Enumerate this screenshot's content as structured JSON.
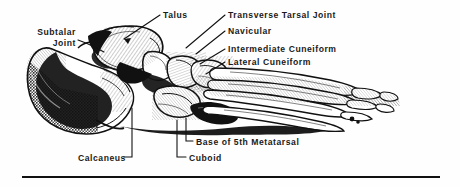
{
  "figure": {
    "background_color": "#fefefe",
    "ink_color": "#111111"
  },
  "labels": {
    "subtalar_joint_line1": "Subtalar",
    "subtalar_joint_line2": "Joint",
    "talus": "Talus",
    "transverse_tarsal_joint": "Transverse Tarsal Joint",
    "navicular": "Navicular",
    "intermediate_cuneiform": "Intermediate Cuneiform",
    "lateral_cuneiform": "Lateral Cuneiform",
    "base_of_5th_metatarsal": "Base of 5th Metatarsal",
    "cuboid": "Cuboid",
    "calcaneus": "Calcaneus"
  },
  "illustration": {
    "style": "pen-and-ink engraving with hatching and stipple",
    "view": "lateral",
    "bones": [
      "calcaneus",
      "talus",
      "navicular",
      "cuboid",
      "lateral cuneiform",
      "intermediate cuneiform",
      "metatarsals",
      "phalanges"
    ]
  },
  "leader_lines": {
    "subtalar_joint": "diagonal from label right edge down-right to subtalar joint",
    "talus": "diagonal from label left edge down-left with arrowhead into talus body",
    "transverse_tarsal_joint": "diagonal from label left edge down-left to talonavicular joint",
    "navicular": "diagonal from label left edge down-left to navicular bone",
    "intermediate_cuneiform": "diagonal from label left edge down-left to intermediate cuneiform",
    "lateral_cuneiform": "diagonal from label left edge down-left to lateral cuneiform",
    "base_of_5th_metatarsal": "L-shaped elbow from label left up to base of 5th metatarsal",
    "cuboid": "L-shaped elbow from label left up to cuboid",
    "calcaneus": "L-shaped elbow from label right up to calcaneus body"
  },
  "rule": {
    "present": true,
    "orientation": "horizontal",
    "color": "#111111"
  }
}
